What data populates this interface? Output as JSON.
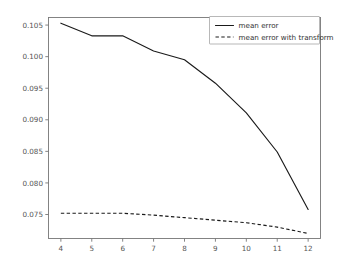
{
  "chart_data": {
    "type": "line",
    "title": "",
    "xlabel": "",
    "ylabel": "",
    "x": [
      4,
      5,
      6,
      7,
      8,
      9,
      10,
      11,
      12
    ],
    "xlim": [
      3.6,
      12.4
    ],
    "ylim": [
      0.0712,
      0.1062
    ],
    "grid": false,
    "legend_position": "upper right",
    "xticks": [
      "4",
      "5",
      "6",
      "7",
      "8",
      "9",
      "10",
      "11",
      "12"
    ],
    "yticks": [
      "0.075",
      "0.080",
      "0.085",
      "0.090",
      "0.095",
      "0.100",
      "0.105"
    ],
    "ytick_values": [
      0.075,
      0.08,
      0.085,
      0.09,
      0.095,
      0.1,
      0.105
    ],
    "series": [
      {
        "name": "mean error",
        "style": "solid",
        "color": "#1a1a1a",
        "values": [
          0.1053,
          0.1033,
          0.1033,
          0.1009,
          0.0995,
          0.0958,
          0.0911,
          0.0849,
          0.0758
        ]
      },
      {
        "name": "mean error with transform",
        "style": "dashed",
        "color": "#1a1a1a",
        "values": [
          0.0752,
          0.0752,
          0.0752,
          0.0749,
          0.0745,
          0.0741,
          0.0737,
          0.073,
          0.072
        ]
      }
    ]
  },
  "legend": {
    "entries": [
      {
        "label": "mean error"
      },
      {
        "label": "mean error with transform"
      }
    ]
  },
  "axes": {
    "x_tick_labels": [
      "4",
      "5",
      "6",
      "7",
      "8",
      "9",
      "10",
      "11",
      "12"
    ],
    "y_tick_labels": [
      "0.075",
      "0.080",
      "0.085",
      "0.090",
      "0.095",
      "0.100",
      "0.105"
    ]
  }
}
